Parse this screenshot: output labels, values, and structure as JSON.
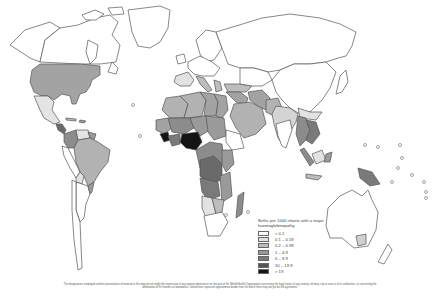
{
  "legend": {
    "title": "Births per 1000 infants with a major haemoglobinopathy",
    "items": [
      {
        "label": "< 0.1",
        "color": "#ffffff"
      },
      {
        "label": "0.1 – 0.19",
        "color": "#e2e2e2"
      },
      {
        "label": "0.2 – 0.99",
        "color": "#bdbdbd"
      },
      {
        "label": "1 – 4.9",
        "color": "#9a9a9a"
      },
      {
        "label": "5 – 9.9",
        "color": "#7a7a7a"
      },
      {
        "label": "10 – 19.9",
        "color": "#555555"
      },
      {
        "label": "> 19",
        "color": "#141414"
      }
    ]
  },
  "footer": {
    "disclaimer": "The designations employed and the presentation of material in this map do not imply the expression of any opinion whatsoever on the part of the World Health Organization concerning the legal status of any country, territory, city or area or of its authorities, or concerning the delimitation of its frontiers or boundaries. Dotted lines represent approximate border lines for which there may not yet be full agreement."
  }
}
